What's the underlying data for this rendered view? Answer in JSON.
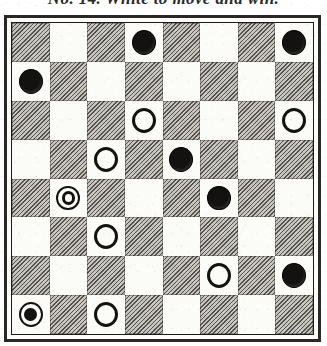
{
  "caption": {
    "text": "No. 14.  White to move and win."
  },
  "board": {
    "label": "draughts-position-diagram",
    "rows": 8,
    "columns": 8,
    "dark_square_color": "#b4b0a8",
    "light_square_color": "#fbfbf8",
    "frame_color": "#2a2724",
    "piece_black_color": "#141210",
    "piece_white_color": "#fdfdfb",
    "square_pattern_note": "dark square occupies column 1 of row 1",
    "cells": [
      [
        {
          "square": "r1c1",
          "shade": "dark",
          "piece": null
        },
        {
          "square": "r1c2",
          "shade": "light",
          "piece": null
        },
        {
          "square": "r1c3",
          "shade": "dark",
          "piece": null
        },
        {
          "square": "r1c4",
          "shade": "light",
          "piece": "black-man"
        },
        {
          "square": "r1c5",
          "shade": "dark",
          "piece": null
        },
        {
          "square": "r1c6",
          "shade": "light",
          "piece": null
        },
        {
          "square": "r1c7",
          "shade": "dark",
          "piece": null
        },
        {
          "square": "r1c8",
          "shade": "light",
          "piece": "black-man"
        }
      ],
      [
        {
          "square": "r2c1",
          "shade": "light",
          "piece": "black-man"
        },
        {
          "square": "r2c2",
          "shade": "dark",
          "piece": null
        },
        {
          "square": "r2c3",
          "shade": "light",
          "piece": null
        },
        {
          "square": "r2c4",
          "shade": "dark",
          "piece": null
        },
        {
          "square": "r2c5",
          "shade": "light",
          "piece": null
        },
        {
          "square": "r2c6",
          "shade": "dark",
          "piece": null
        },
        {
          "square": "r2c7",
          "shade": "light",
          "piece": null
        },
        {
          "square": "r2c8",
          "shade": "dark",
          "piece": null
        }
      ],
      [
        {
          "square": "r3c1",
          "shade": "dark",
          "piece": null
        },
        {
          "square": "r3c2",
          "shade": "light",
          "piece": null
        },
        {
          "square": "r3c3",
          "shade": "dark",
          "piece": null
        },
        {
          "square": "r3c4",
          "shade": "light",
          "piece": "white-man"
        },
        {
          "square": "r3c5",
          "shade": "dark",
          "piece": null
        },
        {
          "square": "r3c6",
          "shade": "light",
          "piece": null
        },
        {
          "square": "r3c7",
          "shade": "dark",
          "piece": null
        },
        {
          "square": "r3c8",
          "shade": "light",
          "piece": "white-man"
        }
      ],
      [
        {
          "square": "r4c1",
          "shade": "light",
          "piece": null
        },
        {
          "square": "r4c2",
          "shade": "dark",
          "piece": null
        },
        {
          "square": "r4c3",
          "shade": "light",
          "piece": "white-man"
        },
        {
          "square": "r4c4",
          "shade": "dark",
          "piece": null
        },
        {
          "square": "r4c5",
          "shade": "light",
          "piece": "black-man"
        },
        {
          "square": "r4c6",
          "shade": "dark",
          "piece": null
        },
        {
          "square": "r4c7",
          "shade": "light",
          "piece": null
        },
        {
          "square": "r4c8",
          "shade": "dark",
          "piece": null
        }
      ],
      [
        {
          "square": "r5c1",
          "shade": "dark",
          "piece": null
        },
        {
          "square": "r5c2",
          "shade": "light",
          "piece": "white-king"
        },
        {
          "square": "r5c3",
          "shade": "dark",
          "piece": null
        },
        {
          "square": "r5c4",
          "shade": "light",
          "piece": null
        },
        {
          "square": "r5c5",
          "shade": "dark",
          "piece": null
        },
        {
          "square": "r5c6",
          "shade": "light",
          "piece": "black-man"
        },
        {
          "square": "r5c7",
          "shade": "dark",
          "piece": null
        },
        {
          "square": "r5c8",
          "shade": "light",
          "piece": null
        }
      ],
      [
        {
          "square": "r6c1",
          "shade": "light",
          "piece": null
        },
        {
          "square": "r6c2",
          "shade": "dark",
          "piece": null
        },
        {
          "square": "r6c3",
          "shade": "light",
          "piece": "white-man"
        },
        {
          "square": "r6c4",
          "shade": "dark",
          "piece": null
        },
        {
          "square": "r6c5",
          "shade": "light",
          "piece": null
        },
        {
          "square": "r6c6",
          "shade": "dark",
          "piece": null
        },
        {
          "square": "r6c7",
          "shade": "light",
          "piece": null
        },
        {
          "square": "r6c8",
          "shade": "dark",
          "piece": null
        }
      ],
      [
        {
          "square": "r7c1",
          "shade": "dark",
          "piece": null
        },
        {
          "square": "r7c2",
          "shade": "light",
          "piece": null
        },
        {
          "square": "r7c3",
          "shade": "dark",
          "piece": null
        },
        {
          "square": "r7c4",
          "shade": "light",
          "piece": null
        },
        {
          "square": "r7c5",
          "shade": "dark",
          "piece": null
        },
        {
          "square": "r7c6",
          "shade": "light",
          "piece": "white-man"
        },
        {
          "square": "r7c7",
          "shade": "dark",
          "piece": null
        },
        {
          "square": "r7c8",
          "shade": "light",
          "piece": "black-man"
        }
      ],
      [
        {
          "square": "r8c1",
          "shade": "light",
          "piece": "black-king"
        },
        {
          "square": "r8c2",
          "shade": "dark",
          "piece": null
        },
        {
          "square": "r8c3",
          "shade": "light",
          "piece": "white-man"
        },
        {
          "square": "r8c4",
          "shade": "dark",
          "piece": null
        },
        {
          "square": "r8c5",
          "shade": "light",
          "piece": null
        },
        {
          "square": "r8c6",
          "shade": "dark",
          "piece": null
        },
        {
          "square": "r8c7",
          "shade": "light",
          "piece": null
        },
        {
          "square": "r8c8",
          "shade": "dark",
          "piece": null
        }
      ]
    ]
  }
}
